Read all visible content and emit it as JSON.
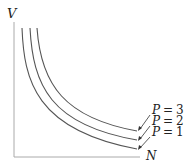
{
  "diagram": {
    "y_axis_label": "V",
    "x_axis_label": "N",
    "curves": [
      {
        "param": "P",
        "eq": "=",
        "value": "3",
        "label": "P = 3"
      },
      {
        "param": "P",
        "eq": "=",
        "value": "2",
        "label": "P = 2"
      },
      {
        "param": "P",
        "eq": "=",
        "value": "1",
        "label": "P = 1"
      }
    ],
    "colors": {
      "curve": "#555555",
      "axis": "#999999",
      "text": "#222222"
    }
  }
}
